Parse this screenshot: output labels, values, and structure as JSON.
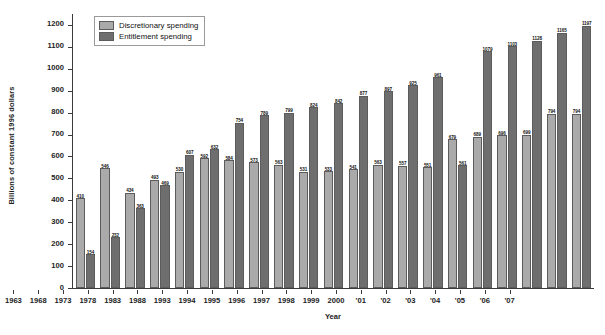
{
  "chart_data": {
    "type": "bar",
    "title": "",
    "xlabel": "Year",
    "ylabel": "Billions of constant 1996 dollars",
    "ylim": [
      0,
      1250
    ],
    "yticks": [
      0,
      100,
      200,
      300,
      400,
      500,
      600,
      700,
      800,
      900,
      1000,
      1100,
      1200
    ],
    "grid": false,
    "legend_position": "top-left",
    "categories": [
      "1963",
      "1968",
      "1973",
      "1978",
      "1983",
      "1988",
      "1993",
      "1994",
      "1995",
      "1996",
      "1997",
      "1998",
      "1999",
      "2000",
      "'01",
      "'02",
      "'03",
      "'04",
      "'05",
      "'06",
      "'07"
    ],
    "series": [
      {
        "name": "Discretionary spending",
        "color": "#aaaaaa",
        "values": [
          410,
          546,
          434,
          493,
          530,
          592,
          584,
          573,
          563,
          531,
          533,
          541,
          563,
          557,
          551,
          679,
          689,
          696,
          699,
          794,
          794
        ]
      },
      {
        "name": "Entitlement spending",
        "color": "#6e6e6e",
        "values": [
          154,
          232,
          363,
          469,
          607,
          632,
          754,
          789,
          799,
          824,
          842,
          877,
          897,
          925,
          961,
          561,
          1079,
          1103,
          1128,
          1165,
          1197
        ]
      }
    ]
  },
  "legend": {
    "items": [
      {
        "label": "Discretionary spending",
        "swatch": "discretionary"
      },
      {
        "label": "Entitlement spending",
        "swatch": "entitlement"
      }
    ]
  }
}
